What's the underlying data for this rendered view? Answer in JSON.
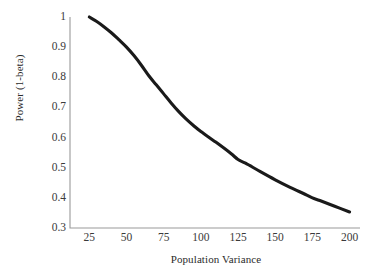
{
  "chart_data": {
    "type": "line",
    "title": "",
    "subtitle": "",
    "xlabel": "Population Variance",
    "ylabel": "Power (1-beta)",
    "xlim": [
      12,
      207
    ],
    "ylim": [
      0.3,
      1.0
    ],
    "grid": false,
    "legend": "none",
    "x_ticks": [
      "25",
      "50",
      "75",
      "100",
      "125",
      "150",
      "175",
      "200"
    ],
    "x_tick_values": [
      25,
      50,
      75,
      100,
      125,
      150,
      175,
      200
    ],
    "y_ticks": [
      "1",
      "0.9",
      "0.8",
      "0.7",
      "0.6",
      "0.5",
      "0.4",
      "0.3"
    ],
    "y_tick_values": [
      1,
      0.9,
      0.8,
      0.7,
      0.6,
      0.5,
      0.4,
      0.3
    ],
    "series": [
      {
        "name": "Power",
        "color": "#1a1a1a",
        "x": [
          25,
          30,
          35,
          40,
          45,
          50,
          55,
          60,
          65,
          70,
          75,
          80,
          85,
          90,
          95,
          100,
          110,
          120,
          125,
          130,
          140,
          150,
          160,
          170,
          175,
          180,
          190,
          200
        ],
        "values": [
          1.0,
          0.985,
          0.967,
          0.947,
          0.924,
          0.9,
          0.872,
          0.84,
          0.805,
          0.775,
          0.745,
          0.715,
          0.687,
          0.662,
          0.64,
          0.62,
          0.585,
          0.548,
          0.527,
          0.515,
          0.487,
          0.46,
          0.435,
          0.412,
          0.4,
          0.391,
          0.372,
          0.353
        ]
      }
    ],
    "axes_color": "#9a9a9a",
    "background_color": "#ffffff",
    "text_color": "#2b2b2b"
  },
  "geometry": {
    "plot_left": 70,
    "plot_right": 360,
    "plot_top": 17,
    "plot_bottom": 228
  }
}
